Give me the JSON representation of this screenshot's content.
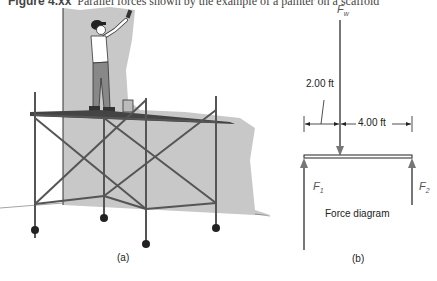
{
  "caption": {
    "figure_number": "Figure 4.xx",
    "text": "Parallel forces shown by the example of a painter on a scaffold"
  },
  "panel_a": {
    "label": "(a)",
    "description": "Painter standing on a wheeled scaffold painting a gray wall"
  },
  "panel_b": {
    "label": "(b)",
    "title": "Force diagram",
    "forces": {
      "fw": {
        "symbol": "F",
        "subscript": "w"
      },
      "f1": {
        "symbol": "F",
        "subscript": "1"
      },
      "f2": {
        "symbol": "F",
        "subscript": "2"
      }
    },
    "dimensions": {
      "left": "2.00 ft",
      "right": "4.00 ft"
    }
  },
  "colors": {
    "wall": "#c8c8c8",
    "arrow": "#777777",
    "beam": "#222222",
    "scaffold": "#555555"
  }
}
